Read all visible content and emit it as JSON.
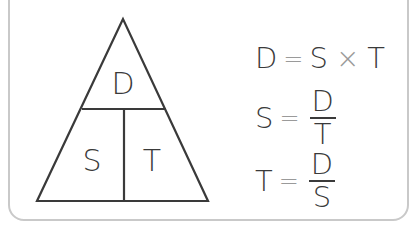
{
  "diagram": {
    "triangle": {
      "top": "D",
      "bottom_left": "S",
      "bottom_right": "T",
      "line_color": "#3a3a3a"
    },
    "formulas": [
      {
        "lhs": "D",
        "eq": "=",
        "a": "S",
        "op": "×",
        "b": "T"
      },
      {
        "lhs": "S",
        "eq": "=",
        "numerator": "D",
        "denominator": "T"
      },
      {
        "lhs": "T",
        "eq": "=",
        "numerator": "D",
        "denominator": "S"
      }
    ],
    "colors": {
      "text": "#3a3a3a",
      "operator": "#9a9a9a",
      "border": "#c9c9c9"
    }
  }
}
